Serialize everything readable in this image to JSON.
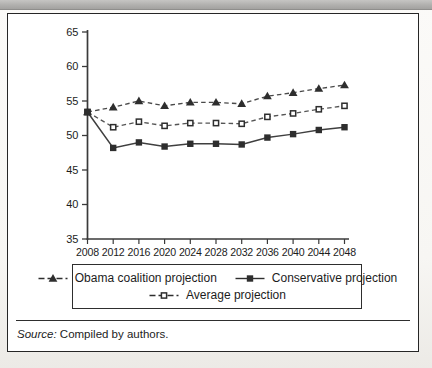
{
  "page": {
    "background": "#f7f6f3"
  },
  "top_bar": {
    "color": "#b1b0ae"
  },
  "colors": {
    "axis": "#3a3a3a",
    "tick_text": "#1c1c1c",
    "series_dark": "#2e2e2e",
    "line_obama": "#4a4a4a",
    "line_conservative": "#3f3f3f",
    "line_average": "#555555",
    "figure_border": "#262626"
  },
  "figure": {
    "source_label": "Source:",
    "source_text": "Compiled by authors."
  },
  "chart_data": {
    "type": "line",
    "title": "",
    "xlabel": "",
    "ylabel": "",
    "grid": false,
    "legend_position": "bottom-boxed",
    "ylim": [
      35,
      65
    ],
    "y_ticks": [
      35,
      40,
      45,
      50,
      55,
      60,
      65
    ],
    "categories": [
      "2008",
      "2012",
      "2016",
      "2020",
      "2024",
      "2028",
      "2032",
      "2036",
      "2040",
      "2044",
      "2048"
    ],
    "series": [
      {
        "name": "Obama coalition projection",
        "line": "dashed",
        "marker": "triangle-filled",
        "values": [
          53.4,
          54.1,
          55.0,
          54.3,
          54.8,
          54.8,
          54.6,
          55.7,
          56.2,
          56.8,
          57.3
        ]
      },
      {
        "name": "Conservative projection",
        "line": "solid",
        "marker": "square-filled",
        "values": [
          53.4,
          48.2,
          49.0,
          48.4,
          48.8,
          48.8,
          48.7,
          49.7,
          50.2,
          50.8,
          51.2
        ]
      },
      {
        "name": "Average projection",
        "line": "dashed",
        "marker": "square-open",
        "values": [
          53.4,
          51.2,
          52.0,
          51.4,
          51.8,
          51.8,
          51.7,
          52.7,
          53.2,
          53.8,
          54.3
        ]
      }
    ]
  }
}
